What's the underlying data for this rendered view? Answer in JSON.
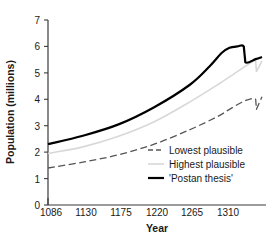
{
  "chart_data": {
    "type": "line",
    "title": "",
    "xlabel": "Year",
    "ylabel": "Population (millions)",
    "xlim": [
      1086,
      1356
    ],
    "ylim": [
      0,
      7
    ],
    "xticks": [
      1086,
      1130,
      1175,
      1220,
      1265,
      1310
    ],
    "yticks": [
      0,
      1,
      2,
      3,
      4,
      5,
      6,
      7
    ],
    "grid": false,
    "legend_position": "center-right",
    "series": [
      {
        "name": "Lowest plausible",
        "style": "dashed",
        "color": "#555555",
        "x": [
          1086,
          1130,
          1175,
          1220,
          1265,
          1300,
          1315,
          1330,
          1340,
          1348,
          1349,
          1356
        ],
        "values": [
          1.4,
          1.62,
          1.9,
          2.3,
          2.85,
          3.35,
          3.62,
          3.88,
          4.0,
          4.0,
          3.62,
          4.1
        ]
      },
      {
        "name": "Highest plausible",
        "style": "solid",
        "color": "#d8d8d8",
        "x": [
          1086,
          1130,
          1175,
          1220,
          1265,
          1300,
          1315,
          1330,
          1340,
          1348,
          1349,
          1356
        ],
        "values": [
          1.95,
          2.2,
          2.6,
          3.15,
          3.9,
          4.55,
          4.85,
          5.15,
          5.35,
          5.45,
          5.05,
          5.45
        ]
      },
      {
        "name": "'Postan thesis'",
        "style": "solid",
        "color": "#000000",
        "x": [
          1086,
          1130,
          1175,
          1220,
          1265,
          1290,
          1305,
          1315,
          1325,
          1333,
          1335,
          1348,
          1356
        ],
        "values": [
          2.3,
          2.62,
          3.05,
          3.7,
          4.55,
          5.25,
          5.75,
          5.95,
          6.0,
          6.0,
          5.4,
          5.52,
          5.6
        ]
      }
    ]
  },
  "legend": {
    "items": [
      {
        "label": "Lowest plausible"
      },
      {
        "label": "Highest plausible"
      },
      {
        "label": "'Postan thesis'"
      }
    ]
  },
  "axes": {
    "x_title": "Year",
    "y_title": "Population (millions)",
    "x_tick_labels": [
      "1086",
      "1130",
      "1175",
      "1220",
      "1265",
      "1310"
    ],
    "y_tick_labels": [
      "0",
      "1",
      "2",
      "3",
      "4",
      "5",
      "6",
      "7"
    ]
  }
}
